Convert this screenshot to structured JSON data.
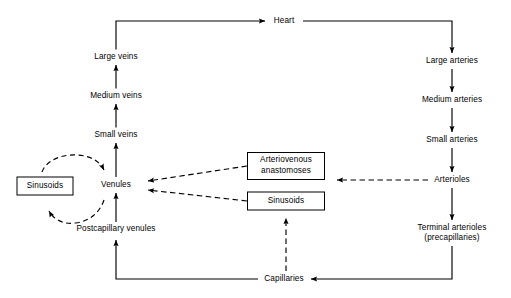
{
  "diagram": {
    "type": "flowchart",
    "background_color": "#ffffff",
    "line_color": "#000000",
    "nodes": {
      "heart": {
        "label": "Heart",
        "shape": "plain",
        "x": 284,
        "y": 21
      },
      "large_arteries": {
        "label": "Large arteries",
        "shape": "plain",
        "x": 452,
        "y": 61
      },
      "medium_arteries": {
        "label": "Medium arteries",
        "shape": "plain",
        "x": 452,
        "y": 100
      },
      "small_arteries": {
        "label": "Small arteries",
        "shape": "plain",
        "x": 452,
        "y": 140
      },
      "arterioles": {
        "label": "Arterioles",
        "shape": "plain",
        "x": 452,
        "y": 180
      },
      "terminal_arterioles": {
        "label": "Terminal arterioles\n(precapillaries)",
        "shape": "plain",
        "x": 452,
        "y": 233
      },
      "capillaries": {
        "label": "Capillaries",
        "shape": "plain",
        "x": 284,
        "y": 279
      },
      "postcapillary_venules": {
        "label": "Postcapillary venules",
        "shape": "plain",
        "x": 116,
        "y": 229
      },
      "venules": {
        "label": "Venules",
        "shape": "plain",
        "x": 116,
        "y": 185
      },
      "small_veins": {
        "label": "Small veins",
        "shape": "plain",
        "x": 116,
        "y": 135
      },
      "medium_veins": {
        "label": "Medium veins",
        "shape": "plain",
        "x": 116,
        "y": 96
      },
      "large_veins": {
        "label": "Large veins",
        "shape": "plain",
        "x": 116,
        "y": 57
      },
      "sinusoids_left": {
        "label": "Sinusoids",
        "shape": "box",
        "x": 45,
        "y": 186,
        "w": 57,
        "h": 19
      },
      "arteriovenous_anastomoses": {
        "label": "Arteriovenous\nanastomoses",
        "shape": "box",
        "x": 286,
        "y": 166,
        "w": 78,
        "h": 28
      },
      "sinusoids_center": {
        "label": "Sinusoids",
        "shape": "box",
        "x": 286,
        "y": 201,
        "w": 78,
        "h": 19
      }
    },
    "edges": [
      {
        "from": "large_veins",
        "to": "heart",
        "style": "solid",
        "name": "large-veins-to-heart"
      },
      {
        "from": "heart",
        "to": "large_arteries",
        "style": "solid",
        "name": "heart-to-large-arteries"
      },
      {
        "from": "large_arteries",
        "to": "medium_arteries",
        "style": "solid",
        "name": "large-to-medium-arteries"
      },
      {
        "from": "medium_arteries",
        "to": "small_arteries",
        "style": "solid",
        "name": "medium-to-small-arteries"
      },
      {
        "from": "small_arteries",
        "to": "arterioles",
        "style": "solid",
        "name": "small-arteries-to-arterioles"
      },
      {
        "from": "arterioles",
        "to": "terminal_arterioles",
        "style": "solid",
        "name": "arterioles-to-terminal-arterioles"
      },
      {
        "from": "terminal_arterioles",
        "to": "capillaries",
        "style": "solid",
        "name": "terminal-arterioles-to-capillaries"
      },
      {
        "from": "capillaries",
        "to": "postcapillary_venules",
        "style": "solid",
        "name": "capillaries-to-postcapillary-venules"
      },
      {
        "from": "postcapillary_venules",
        "to": "venules",
        "style": "solid",
        "name": "postcapillary-venules-to-venules"
      },
      {
        "from": "venules",
        "to": "small_veins",
        "style": "solid",
        "name": "venules-to-small-veins"
      },
      {
        "from": "small_veins",
        "to": "medium_veins",
        "style": "solid",
        "name": "small-to-medium-veins"
      },
      {
        "from": "medium_veins",
        "to": "large_veins",
        "style": "solid",
        "name": "medium-to-large-veins"
      },
      {
        "from": "arterioles",
        "to": "arteriovenous_anastomoses",
        "style": "dashed",
        "name": "arterioles-to-av-anastomoses"
      },
      {
        "from": "arteriovenous_anastomoses",
        "to": "venules",
        "style": "dashed",
        "name": "av-anastomoses-to-venules"
      },
      {
        "from": "capillaries",
        "to": "sinusoids_center",
        "style": "dashed",
        "name": "capillaries-to-sinusoids"
      },
      {
        "from": "sinusoids_center",
        "to": "venules",
        "style": "dashed",
        "name": "sinusoids-to-venules"
      },
      {
        "from": "sinusoids_left",
        "to": "venules",
        "style": "dashed-curve",
        "name": "sinusoids-left-to-venules"
      },
      {
        "from": "venules",
        "to": "sinusoids_left",
        "style": "dashed-curve",
        "name": "venules-to-sinusoids-left"
      }
    ]
  }
}
